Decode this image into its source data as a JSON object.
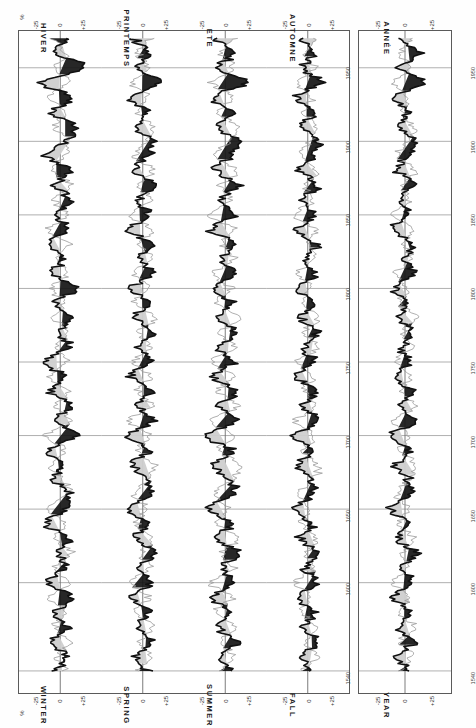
{
  "figure": {
    "unit_label": "%",
    "value_axis": {
      "ticks": [
        {
          "value": 25,
          "label": "+25"
        },
        {
          "value": 0,
          "label": "0"
        },
        {
          "value": -25,
          "label": "-25"
        }
      ],
      "range": [
        -40,
        40
      ]
    },
    "time_axis": {
      "label_top": "",
      "ticks": [
        {
          "value": 1950,
          "label": "1950"
        },
        {
          "value": 1900,
          "label": "1900"
        },
        {
          "value": 1850,
          "label": "1850"
        },
        {
          "value": 1800,
          "label": "1800"
        },
        {
          "value": 1750,
          "label": "1750"
        },
        {
          "value": 1700,
          "label": "1700"
        },
        {
          "value": 1650,
          "label": "1650"
        },
        {
          "value": 1600,
          "label": "1600"
        },
        {
          "value": 1540,
          "label": "1540"
        }
      ],
      "range": [
        1525,
        1975
      ]
    },
    "panels": [
      {
        "id": "winter",
        "title_fr": "HIVER",
        "title_en": "WINTER"
      },
      {
        "id": "spring",
        "title_fr": "PRINTEMPS",
        "title_en": "SPRING"
      },
      {
        "id": "summer",
        "title_fr": "ETE",
        "title_en": "SUMMER"
      },
      {
        "id": "autumn",
        "title_fr": "AUTOMNE",
        "title_en": "FALL"
      },
      {
        "id": "annual",
        "title_fr": "ANNÉE",
        "title_en": "YEAR"
      }
    ]
  },
  "chart_data": {
    "type": "line",
    "title": "",
    "subtitle": "",
    "xlabel": "",
    "ylabel": "%",
    "orientation": "vertical-time-axis",
    "xlim": [
      1525,
      1975
    ],
    "ylim": [
      -40,
      40
    ],
    "grid": true,
    "legend_position": "none",
    "axis_ticks_x": [
      1540,
      1600,
      1650,
      1700,
      1750,
      1800,
      1850,
      1900,
      1950
    ],
    "axis_ticks_y": [
      25,
      0,
      -25
    ],
    "series_styles": [
      {
        "name": "thick-black-curve",
        "color": "#111111",
        "width": 1.6
      },
      {
        "name": "thin-grey-curve",
        "color": "#9a9a9a",
        "width": 0.8
      },
      {
        "name": "positive-fill",
        "color": "#151515"
      },
      {
        "name": "negative-fill",
        "color": "#cfcfcf"
      }
    ],
    "panels": [
      {
        "id": "winter",
        "name_fr": "HIVER",
        "name_en": "WINTER",
        "x": [
          1540,
          1550,
          1560,
          1570,
          1580,
          1590,
          1600,
          1610,
          1620,
          1630,
          1640,
          1650,
          1660,
          1670,
          1680,
          1690,
          1700,
          1710,
          1720,
          1730,
          1740,
          1750,
          1760,
          1770,
          1780,
          1790,
          1800,
          1810,
          1820,
          1830,
          1840,
          1850,
          1860,
          1870,
          1880,
          1890,
          1900,
          1910,
          1920,
          1930,
          1940,
          1950,
          1960,
          1970
        ],
        "series": [
          {
            "name": "thick-black-curve",
            "values": [
              -4,
              6,
              -10,
              8,
              -6,
              12,
              -14,
              5,
              -2,
              9,
              -16,
              6,
              10,
              -8,
              4,
              -12,
              20,
              -6,
              14,
              -10,
              5,
              -18,
              9,
              -3,
              12,
              -7,
              16,
              -9,
              4,
              -13,
              7,
              -2,
              11,
              -6,
              9,
              -14,
              5,
              18,
              -8,
              12,
              -20,
              26,
              -5,
              8
            ]
          },
          {
            "name": "thin-grey-curve",
            "values": [
              6,
              -3,
              9,
              -7,
              5,
              -10,
              8,
              -4,
              11,
              -6,
              4,
              -12,
              7,
              3,
              -9,
              6,
              -14,
              10,
              -5,
              8,
              -11,
              6,
              -4,
              9,
              -7,
              5,
              -10,
              7,
              -3,
              8,
              -12,
              6,
              -5,
              10,
              -7,
              4,
              9,
              -6,
              5,
              -11,
              8,
              -4,
              6,
              -9
            ]
          }
        ]
      },
      {
        "id": "spring",
        "name_fr": "PRINTEMPS",
        "name_en": "SPRING",
        "x": [
          1540,
          1550,
          1560,
          1570,
          1580,
          1590,
          1600,
          1610,
          1620,
          1630,
          1640,
          1650,
          1660,
          1670,
          1680,
          1690,
          1700,
          1710,
          1720,
          1730,
          1740,
          1750,
          1760,
          1770,
          1780,
          1790,
          1800,
          1810,
          1820,
          1830,
          1840,
          1850,
          1860,
          1870,
          1880,
          1890,
          1900,
          1910,
          1920,
          1930,
          1940,
          1950,
          1960,
          1970
        ],
        "series": [
          {
            "name": "thick-black-curve",
            "values": [
              5,
              -8,
              10,
              -6,
              7,
              -12,
              9,
              -4,
              13,
              -9,
              6,
              -15,
              8,
              4,
              -11,
              7,
              -16,
              12,
              -6,
              9,
              -13,
              7,
              -5,
              11,
              -8,
              6,
              -12,
              9,
              -4,
              10,
              -14,
              7,
              -6,
              12,
              -9,
              5,
              11,
              -7,
              6,
              -13,
              17,
              -6,
              8,
              -11
            ]
          },
          {
            "name": "thin-grey-curve",
            "values": [
              -6,
              9,
              -4,
              11,
              -8,
              5,
              -13,
              7,
              -3,
              10,
              -7,
              4,
              -9,
              6,
              12,
              -5,
              8,
              -14,
              10,
              -6,
              7,
              -11,
              9,
              -4,
              12,
              -8,
              5,
              -10,
              8,
              -3,
              9,
              -13,
              6,
              -5,
              11,
              -8,
              4,
              10,
              -6,
              5,
              -12,
              7,
              -4,
              9
            ]
          }
        ]
      },
      {
        "id": "summer",
        "name_fr": "ETE",
        "name_en": "SUMMER",
        "x": [
          1540,
          1550,
          1560,
          1570,
          1580,
          1590,
          1600,
          1610,
          1620,
          1630,
          1640,
          1650,
          1660,
          1670,
          1680,
          1690,
          1700,
          1710,
          1720,
          1730,
          1740,
          1750,
          1760,
          1770,
          1780,
          1790,
          1800,
          1810,
          1820,
          1830,
          1840,
          1850,
          1860,
          1870,
          1880,
          1890,
          1900,
          1910,
          1920,
          1930,
          1940,
          1950,
          1960,
          1970
        ],
        "series": [
          {
            "name": "thick-black-curve",
            "values": [
              8,
              -5,
              12,
              -9,
              6,
              -14,
              10,
              -4,
              15,
              -10,
              7,
              -18,
              9,
              5,
              -12,
              8,
              -20,
              14,
              -7,
              11,
              -15,
              8,
              -6,
              13,
              -9,
              7,
              -14,
              10,
              -5,
              12,
              -16,
              8,
              -7,
              14,
              -10,
              6,
              13,
              -8,
              7,
              -15,
              22,
              -8,
              10,
              -12
            ]
          },
          {
            "name": "thin-grey-curve",
            "values": [
              -7,
              10,
              -5,
              13,
              -9,
              6,
              -15,
              8,
              -4,
              12,
              -8,
              5,
              -11,
              7,
              14,
              -6,
              9,
              -16,
              12,
              -7,
              8,
              -13,
              10,
              -5,
              14,
              -9,
              6,
              -12,
              9,
              -4,
              10,
              -15,
              7,
              -6,
              13,
              -9,
              5,
              12,
              -7,
              6,
              -14,
              8,
              -5,
              11
            ]
          }
        ]
      },
      {
        "id": "autumn",
        "name_fr": "AUTOMNE",
        "name_en": "FALL",
        "x": [
          1540,
          1550,
          1560,
          1570,
          1580,
          1590,
          1600,
          1610,
          1620,
          1630,
          1640,
          1650,
          1660,
          1670,
          1680,
          1690,
          1700,
          1710,
          1720,
          1730,
          1740,
          1750,
          1760,
          1770,
          1780,
          1790,
          1800,
          1810,
          1820,
          1830,
          1840,
          1850,
          1860,
          1870,
          1880,
          1890,
          1900,
          1910,
          1920,
          1930,
          1940,
          1950,
          1960,
          1970
        ],
        "series": [
          {
            "name": "thick-black-curve",
            "values": [
              4,
              -7,
              9,
              -5,
              6,
              -11,
              8,
              -3,
              12,
              -8,
              5,
              -14,
              7,
              3,
              -10,
              6,
              -15,
              11,
              -5,
              8,
              -12,
              6,
              -4,
              10,
              -7,
              5,
              -11,
              8,
              -3,
              9,
              -13,
              6,
              -5,
              11,
              -8,
              4,
              10,
              -6,
              5,
              -12,
              15,
              -5,
              7,
              -10
            ]
          },
          {
            "name": "thin-grey-curve",
            "values": [
              -5,
              8,
              -3,
              10,
              -7,
              4,
              -12,
              6,
              -2,
              9,
              -6,
              3,
              -8,
              5,
              11,
              -4,
              7,
              -13,
              9,
              -5,
              6,
              -10,
              8,
              -3,
              11,
              -7,
              4,
              -9,
              7,
              -2,
              8,
              -12,
              5,
              -4,
              10,
              -7,
              3,
              9,
              -5,
              4,
              -11,
              6,
              -3,
              8
            ]
          }
        ]
      },
      {
        "id": "annual",
        "name_fr": "ANNÉE",
        "name_en": "YEAR",
        "x": [
          1540,
          1550,
          1560,
          1570,
          1580,
          1590,
          1600,
          1610,
          1620,
          1630,
          1640,
          1650,
          1660,
          1670,
          1680,
          1690,
          1700,
          1710,
          1720,
          1730,
          1740,
          1750,
          1760,
          1770,
          1780,
          1790,
          1800,
          1810,
          1820,
          1830,
          1840,
          1850,
          1860,
          1870,
          1880,
          1890,
          1900,
          1910,
          1920,
          1930,
          1940,
          1950,
          1960,
          1970
        ],
        "series": [
          {
            "name": "thick-black-curve",
            "values": [
              3,
              -6,
              8,
              -5,
              5,
              -10,
              7,
              -3,
              11,
              -7,
              4,
              -13,
              6,
              3,
              -9,
              5,
              -14,
              10,
              -5,
              7,
              -11,
              5,
              -4,
              9,
              -6,
              4,
              -10,
              7,
              -3,
              8,
              -12,
              5,
              -4,
              10,
              -7,
              3,
              9,
              -5,
              4,
              -11,
              19,
              -6,
              14,
              -9
            ]
          },
          {
            "name": "thin-grey-curve",
            "values": [
              -4,
              7,
              -3,
              9,
              -6,
              4,
              -11,
              5,
              -2,
              8,
              -5,
              3,
              -7,
              4,
              10,
              -4,
              6,
              -12,
              8,
              -4,
              5,
              -9,
              7,
              -3,
              10,
              -6,
              3,
              -8,
              6,
              -2,
              7,
              -11,
              4,
              -3,
              9,
              -6,
              3,
              8,
              -4,
              3,
              -10,
              5,
              -3,
              7
            ]
          }
        ]
      }
    ]
  }
}
